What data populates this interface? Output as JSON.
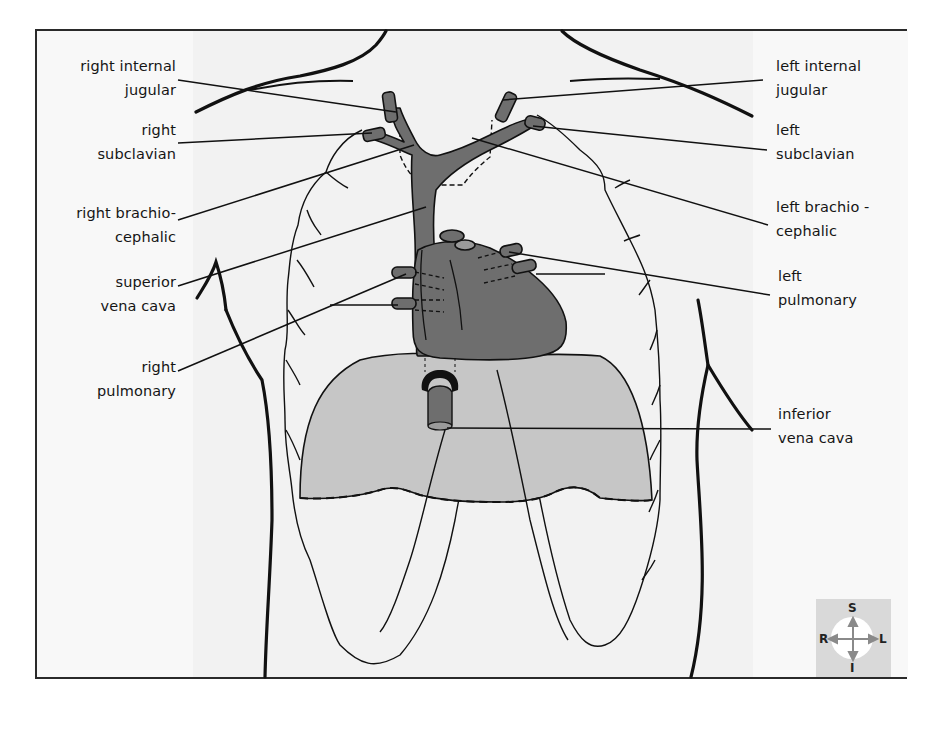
{
  "figure": {
    "labels_right_side_of_body": {
      "right_internal_jugular": [
        "right internal",
        "jugular"
      ],
      "right_subclavian": [
        "right",
        "subclavian"
      ],
      "right_brachiocephalic": [
        "right brachio-",
        "cephalic"
      ],
      "superior_vena_cava": [
        "superior",
        "vena cava"
      ],
      "right_pulmonary": [
        "right",
        "pulmonary"
      ]
    },
    "labels_left_side_of_body": {
      "left_internal_jugular": [
        "left internal",
        "jugular"
      ],
      "left_subclavian": [
        "left",
        "subclavian"
      ],
      "left_brachiocephalic": [
        "left brachio -",
        "cephalic"
      ],
      "left_pulmonary": [
        "left",
        "pulmonary"
      ],
      "inferior_vena_cava": [
        "inferior",
        "vena cava"
      ]
    },
    "compass": {
      "superior": "S",
      "inferior": "I",
      "right": "R",
      "left": "L"
    },
    "colors": {
      "background": "#f7f7f7",
      "vessel_fill": "#6e6e6e",
      "diaphragm_fill": "#c4c4c4",
      "outline": "#111111",
      "compass_bg": "#d9d9d9",
      "compass_arrows": "#8a8a8a"
    }
  }
}
